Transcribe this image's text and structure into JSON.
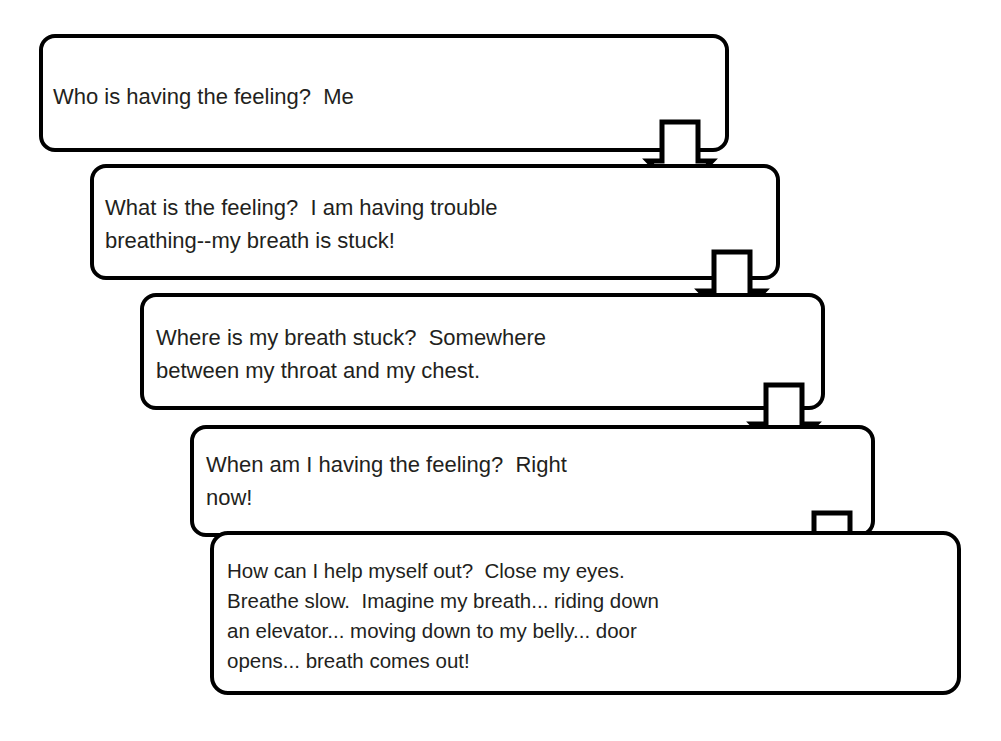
{
  "diagram": {
    "background_color": "#ffffff",
    "line_color": "#000000",
    "text_color": "#231f20",
    "steps": [
      {
        "id": "step-who",
        "lines": [
          "Who is having the feeling?  Me"
        ]
      },
      {
        "id": "step-what",
        "lines": [
          "What is the feeling?  I am having trouble",
          "breathing--my breath is stuck!"
        ]
      },
      {
        "id": "step-where",
        "lines": [
          "Where is my breath stuck?  Somewhere",
          "between my throat and my chest."
        ]
      },
      {
        "id": "step-when",
        "lines": [
          "When am I having the feeling?  Right",
          "now!"
        ]
      },
      {
        "id": "step-how",
        "lines": [
          "How can I help myself out?  Close my eyes.",
          "Breathe slow.  Imagine my breath... riding down",
          "an elevator... moving down to my belly... door",
          "opens... breath comes out!"
        ]
      }
    ],
    "connectors": [
      {
        "id": "arrow-who-to-what",
        "icon": "down-arrow-icon"
      },
      {
        "id": "arrow-what-to-where",
        "icon": "down-arrow-icon"
      },
      {
        "id": "arrow-where-to-when",
        "icon": "down-arrow-icon"
      },
      {
        "id": "arrow-when-to-how",
        "icon": "down-arrow-icon"
      }
    ]
  }
}
